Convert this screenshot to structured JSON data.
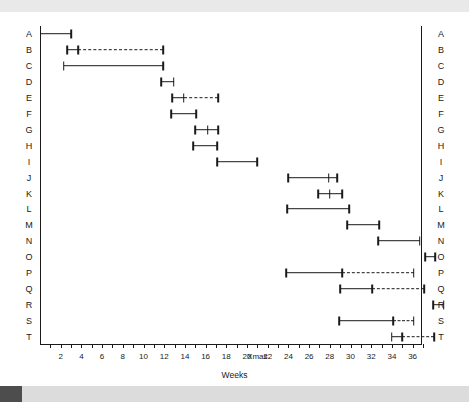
{
  "chart_data": {
    "type": "bar",
    "subtype": "gantt",
    "title": "",
    "xlabel": "Weeks",
    "ylabel": "",
    "xlim": [
      0,
      36
    ],
    "grid": false,
    "legend": null,
    "axis": {
      "tick_labels": [
        "2",
        "4",
        "6",
        "8",
        "10",
        "12",
        "14",
        "16",
        "18",
        "20",
        "Xmas",
        "22",
        "24",
        "26",
        "28",
        "30",
        "32",
        "34",
        "36"
      ],
      "tick_values": [
        2,
        4,
        6,
        8,
        10,
        12,
        14,
        16,
        18,
        20,
        21,
        22,
        24,
        26,
        28,
        30,
        32,
        34,
        36
      ],
      "minor_tick_step": 1,
      "xmas_label": "Xmas",
      "xmas_value": 21
    },
    "row_labels": [
      "A",
      "B",
      "C",
      "D",
      "E",
      "F",
      "G",
      "H",
      "I",
      "J",
      "K",
      "L",
      "M",
      "N",
      "O",
      "P",
      "Q",
      "R",
      "S",
      "T"
    ],
    "categories": [
      "A",
      "B",
      "C",
      "D",
      "E",
      "F",
      "G",
      "H",
      "I",
      "J",
      "K",
      "L",
      "M",
      "N",
      "O",
      "P",
      "Q",
      "R",
      "S",
      "T"
    ],
    "tasks": [
      {
        "id": "A",
        "solid_start": 0,
        "solid_end": 3.0,
        "dashed_start": null,
        "dashed_end": null,
        "mid_tick": null
      },
      {
        "id": "B",
        "solid_start": 2.6,
        "solid_end": 3.7,
        "dashed_start": 3.7,
        "dashed_end": 11.9,
        "mid_tick": null
      },
      {
        "id": "C",
        "solid_start": 2.3,
        "solid_end": 11.9,
        "dashed_start": null,
        "dashed_end": null,
        "mid_tick": null
      },
      {
        "id": "D",
        "solid_start": 11.7,
        "solid_end": 12.9,
        "dashed_start": null,
        "dashed_end": null,
        "mid_tick": null
      },
      {
        "id": "E",
        "solid_start": 12.8,
        "solid_end": 13.9,
        "dashed_start": 13.9,
        "dashed_end": 17.2,
        "mid_tick": null
      },
      {
        "id": "F",
        "solid_start": 12.7,
        "solid_end": 15.1,
        "dashed_start": null,
        "dashed_end": null,
        "mid_tick": null
      },
      {
        "id": "G",
        "solid_start": 15.0,
        "solid_end": 17.2,
        "dashed_start": null,
        "dashed_end": null,
        "mid_tick": 16.2
      },
      {
        "id": "H",
        "solid_start": 14.8,
        "solid_end": 17.1,
        "dashed_start": null,
        "dashed_end": null,
        "mid_tick": null
      },
      {
        "id": "I",
        "solid_start": 17.1,
        "solid_end": 21.0,
        "dashed_start": null,
        "dashed_end": null,
        "mid_tick": null
      },
      {
        "id": "J",
        "solid_start": 24.0,
        "solid_end": 28.7,
        "dashed_start": null,
        "dashed_end": null,
        "mid_tick": 27.9
      },
      {
        "id": "K",
        "solid_start": 26.9,
        "solid_end": 29.2,
        "dashed_start": null,
        "dashed_end": null,
        "mid_tick": 28.0
      },
      {
        "id": "L",
        "solid_start": 23.9,
        "solid_end": 29.9,
        "dashed_start": null,
        "dashed_end": null,
        "mid_tick": null
      },
      {
        "id": "M",
        "solid_start": 29.7,
        "solid_end": 32.8,
        "dashed_start": null,
        "dashed_end": null,
        "mid_tick": null
      },
      {
        "id": "N",
        "solid_start": 32.7,
        "solid_end": 36.7,
        "dashed_start": null,
        "dashed_end": null,
        "mid_tick": null
      },
      {
        "id": "O",
        "solid_start": 37.2,
        "solid_end": 38.2,
        "dashed_start": null,
        "dashed_end": null,
        "mid_tick": null
      },
      {
        "id": "P",
        "solid_start": 23.8,
        "solid_end": 29.2,
        "dashed_start": 29.2,
        "dashed_end": 36.1,
        "mid_tick": null
      },
      {
        "id": "Q",
        "solid_start": 29.0,
        "solid_end": 32.1,
        "dashed_start": 32.1,
        "dashed_end": 37.1,
        "mid_tick": null
      },
      {
        "id": "R",
        "solid_start": 38.0,
        "solid_end": 39.0,
        "dashed_start": null,
        "dashed_end": null,
        "mid_tick": null
      },
      {
        "id": "S",
        "solid_start": 28.9,
        "solid_end": 34.1,
        "dashed_start": 34.1,
        "dashed_end": 36.1,
        "mid_tick": null
      },
      {
        "id": "T",
        "solid_start": 34.0,
        "solid_end": 35.0,
        "dashed_start": 35.0,
        "dashed_end": 38.1,
        "mid_tick": null
      }
    ]
  }
}
